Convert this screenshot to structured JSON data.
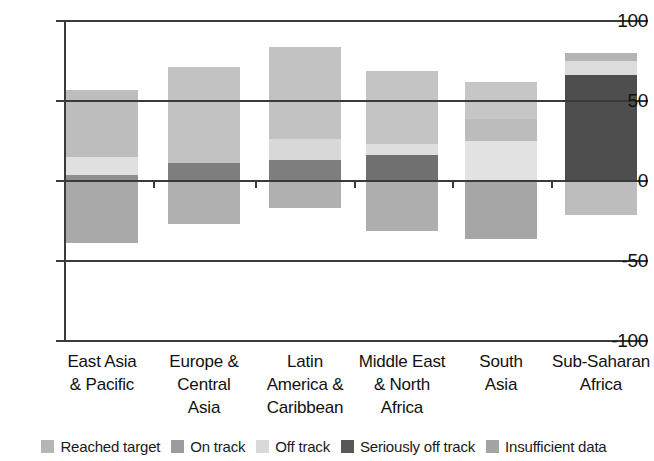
{
  "chart_data": {
    "type": "bar",
    "title": "",
    "subtitle": "",
    "xlabel": "",
    "ylabel": "",
    "stacked": true,
    "grid": false,
    "legend_position": "bottom",
    "ylim": [
      -100,
      100
    ],
    "yticks": [
      100,
      50,
      0,
      -50,
      -100
    ],
    "ytick_labels": [
      "100",
      "50",
      "0",
      "-50",
      "-100"
    ],
    "categories": [
      "East Asia & Pacific",
      "Europe & Central Asia",
      "Latin America & Caribbean",
      "Middle East & North Africa",
      "South Asia",
      "Sub-Saharan Africa"
    ],
    "category_lines": [
      [
        "East Asia",
        "& Pacific"
      ],
      [
        "Europe &",
        "Central",
        "Asia"
      ],
      [
        "Latin",
        "America &",
        "Caribbean"
      ],
      [
        "Middle East",
        "& North",
        "Africa"
      ],
      [
        "South",
        "Asia"
      ],
      [
        "Sub-Saharan",
        "Africa"
      ]
    ],
    "series": [
      {
        "name": "Reached target",
        "color": "#a8a8a8",
        "values": [
          4,
          11,
          13,
          16,
          0,
          66
        ]
      },
      {
        "name": "On track",
        "color": "#9a9a9a",
        "values": [
          0,
          0,
          0,
          0,
          25,
          0
        ]
      },
      {
        "name": "Off track",
        "color": "#e0e0e0",
        "values": [
          11,
          0,
          13,
          7,
          14,
          0
        ]
      },
      {
        "name": "Seriously off track",
        "color": "#585858",
        "values": [
          0,
          0,
          0,
          0,
          0,
          0
        ]
      },
      {
        "name": "Insufficient data",
        "color": "#bdbdbd",
        "values": [
          42,
          60,
          58,
          46,
          23,
          9
        ]
      }
    ],
    "negative_values": [
      -39,
      -27,
      -17,
      -31,
      -36,
      -21
    ],
    "bar_totals_positive": [
      57,
      71,
      84,
      69,
      62,
      80
    ],
    "bars": [
      {
        "category": "East Asia & Pacific",
        "x": 66,
        "width": 72,
        "segments": [
          {
            "label": "Insufficient data",
            "from": 15,
            "to": 57,
            "color": "#bdbdbd"
          },
          {
            "label": "Off track",
            "from": 4,
            "to": 15,
            "color": "#e0e0e0"
          },
          {
            "label": "Reached target",
            "from": 0,
            "to": 4,
            "color": "#8f8f8f"
          },
          {
            "label": "Below axis",
            "from": -39,
            "to": 0,
            "color": "#a9a9a9"
          }
        ]
      },
      {
        "category": "Europe & Central Asia",
        "x": 168,
        "width": 72,
        "segments": [
          {
            "label": "Insufficient data",
            "from": 11,
            "to": 71,
            "color": "#c2c2c2"
          },
          {
            "label": "Reached target",
            "from": 0,
            "to": 11,
            "color": "#7e7e7e"
          },
          {
            "label": "Below axis",
            "from": -27,
            "to": 0,
            "color": "#b0b0b0"
          }
        ]
      },
      {
        "category": "Latin America & Caribbean",
        "x": 269,
        "width": 72,
        "segments": [
          {
            "label": "Insufficient data",
            "from": 26,
            "to": 84,
            "color": "#c2c2c2"
          },
          {
            "label": "Off track",
            "from": 13,
            "to": 26,
            "color": "#d8d8d8"
          },
          {
            "label": "Reached target",
            "from": 0,
            "to": 13,
            "color": "#7e7e7e"
          },
          {
            "label": "Below axis",
            "from": -17,
            "to": 0,
            "color": "#b0b0b0"
          }
        ]
      },
      {
        "category": "Middle East & North Africa",
        "x": 366,
        "width": 72,
        "segments": [
          {
            "label": "Insufficient data",
            "from": 23,
            "to": 69,
            "color": "#c4c4c4"
          },
          {
            "label": "Off track",
            "from": 16,
            "to": 23,
            "color": "#dedede"
          },
          {
            "label": "Reached target",
            "from": 0,
            "to": 16,
            "color": "#707070"
          },
          {
            "label": "Below axis",
            "from": -31,
            "to": 0,
            "color": "#aeaeae"
          }
        ]
      },
      {
        "category": "South Asia",
        "x": 465,
        "width": 72,
        "segments": [
          {
            "label": "Insufficient data",
            "from": 39,
            "to": 62,
            "color": "#c6c6c6"
          },
          {
            "label": "On track",
            "from": 25,
            "to": 39,
            "color": "#bcbcbc"
          },
          {
            "label": "Off track",
            "from": 0,
            "to": 25,
            "color": "#e2e2e2"
          },
          {
            "label": "Below axis",
            "from": -36,
            "to": 0,
            "color": "#a6a6a6"
          }
        ]
      },
      {
        "category": "Sub-Saharan Africa",
        "x": 565,
        "width": 72,
        "segments": [
          {
            "label": "Insufficient data",
            "from": 75,
            "to": 80,
            "color": "#b4b4b4"
          },
          {
            "label": "Off track",
            "from": 66,
            "to": 75,
            "color": "#dcdcdc"
          },
          {
            "label": "Reached target",
            "from": 0,
            "to": 66,
            "color": "#4e4e4e"
          },
          {
            "label": "Below axis",
            "from": -21,
            "to": 0,
            "color": "#bdbdbd"
          }
        ]
      }
    ]
  },
  "legend": {
    "items": [
      {
        "label": "Reached target",
        "color": "#b5b5b5"
      },
      {
        "label": "On track",
        "color": "#9b9b9b"
      },
      {
        "label": "Off track",
        "color": "#d9d9d9"
      },
      {
        "label": "Seriously off track",
        "color": "#585858"
      },
      {
        "label": "Insufficient data",
        "color": "#a3a3a3"
      }
    ]
  },
  "axis": {
    "y_labels": [
      "100",
      "50",
      "0",
      "-50",
      "-100"
    ]
  }
}
